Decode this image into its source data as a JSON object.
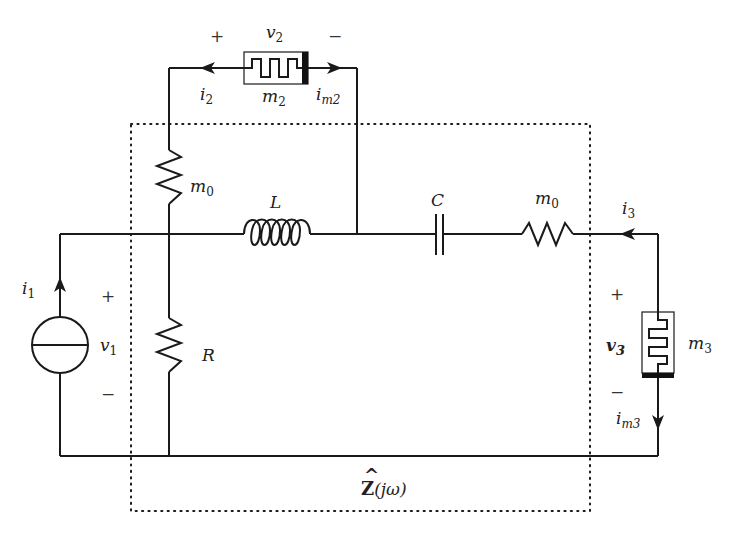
{
  "diagram": {
    "type": "circuit-schematic",
    "boundary_label": {
      "main": "Z",
      "hat": "^",
      "arg": "(jω)"
    },
    "components": {
      "current_source": {
        "current_label": "i",
        "current_sub": "1",
        "voltage_label": "v",
        "voltage_sub": "1",
        "plus": "+",
        "minus": "−"
      },
      "resistor_R": {
        "label": "R"
      },
      "memristor_m0_vertical": {
        "label": "m",
        "sub": "0"
      },
      "inductor": {
        "label": "L"
      },
      "capacitor": {
        "label": "C"
      },
      "memristor_m0_horizontal": {
        "label": "m",
        "sub": "0"
      },
      "memristor_m2": {
        "label": "m",
        "sub": "2",
        "voltage_label": "v",
        "voltage_sub": "2",
        "plus": "+",
        "minus": "−",
        "current_left": "i",
        "current_left_sub": "2",
        "current_right": "i",
        "current_right_sub": "m2"
      },
      "memristor_m3": {
        "label": "m",
        "sub": "3",
        "voltage_label": "v",
        "voltage_sub": "3",
        "plus": "+",
        "minus": "−",
        "current_top": "i",
        "current_top_sub": "3",
        "current_bottom": "i",
        "current_bottom_sub": "m3"
      }
    }
  }
}
